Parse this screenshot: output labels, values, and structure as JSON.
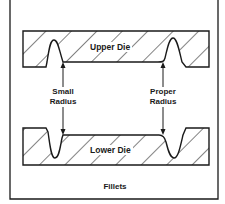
{
  "diagram": {
    "caption": "Fillets",
    "upper_die_label": "Upper Die",
    "lower_die_label": "Lower Die",
    "left_callout": {
      "line1": "Small",
      "line2": "Radius"
    },
    "right_callout": {
      "line1": "Proper",
      "line2": "Radius"
    },
    "colors": {
      "ink": "#1a1a1a",
      "background": "#ffffff"
    }
  }
}
